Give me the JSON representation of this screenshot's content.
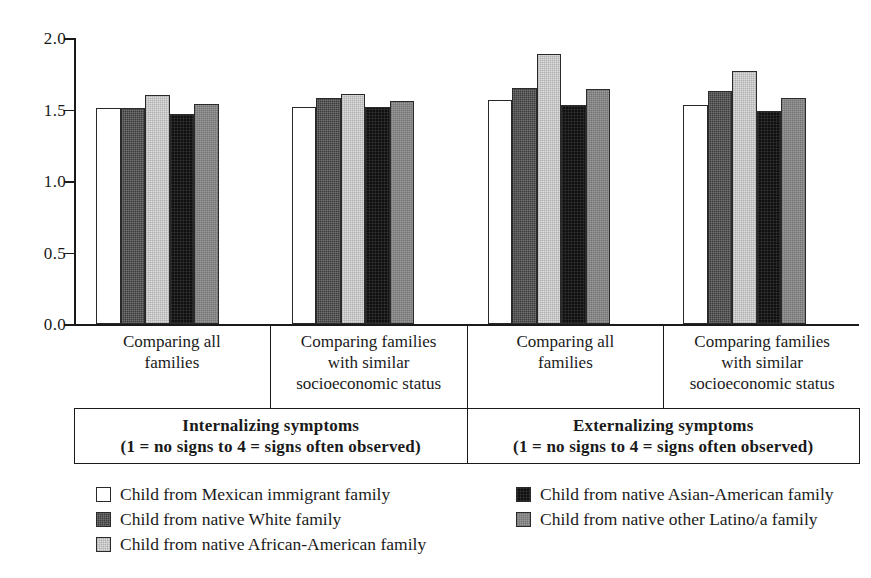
{
  "chart_data": {
    "type": "bar",
    "title": "",
    "xlabel": "",
    "ylabel": "",
    "ylim": [
      0.0,
      2.0
    ],
    "ytick_labels": [
      "2.0",
      "1.5",
      "1.0",
      "0.5",
      "0.0"
    ],
    "ytick_values": [
      2.0,
      1.5,
      1.0,
      0.5,
      0.0
    ],
    "grid": false,
    "legend_position": "below-plot",
    "categories": [
      "Comparing all families",
      "Comparing families with similar socioeconomic status",
      "Comparing all families",
      "Comparing families with similar socioeconomic status"
    ],
    "group_titles": [
      {
        "main": "Internalizing symptoms",
        "sub": "(1 = no signs to 4 = signs often observed)",
        "spans": 2
      },
      {
        "main": "Externalizing symptoms",
        "sub": "(1 = no signs to 4 = signs often observed)",
        "spans": 2
      }
    ],
    "series": [
      {
        "name": "Child from Mexican immigrant family",
        "fill": "white",
        "color": "#ffffff",
        "values": [
          1.51,
          1.52,
          1.57,
          1.53
        ]
      },
      {
        "name": "Child from native White family",
        "fill": "dark-gray",
        "color": "#3d3d3d",
        "values": [
          1.51,
          1.58,
          1.65,
          1.63
        ]
      },
      {
        "name": "Child from native African-American family",
        "fill": "light-gray",
        "color": "#dcdcdc",
        "values": [
          1.6,
          1.61,
          1.89,
          1.77
        ]
      },
      {
        "name": "Child from native Asian-American family",
        "fill": "black",
        "color": "#111111",
        "values": [
          1.47,
          1.52,
          1.53,
          1.49
        ]
      },
      {
        "name": "Child from native other Latino/a family",
        "fill": "mid-gray",
        "color": "#9a9a9a",
        "values": [
          1.54,
          1.56,
          1.64,
          1.58
        ]
      }
    ]
  },
  "axis": {
    "ticks": [
      {
        "label": "2.0",
        "value": 2.0
      },
      {
        "label": "1.5",
        "value": 1.5
      },
      {
        "label": "1.0",
        "value": 1.0
      },
      {
        "label": "0.5",
        "value": 0.5
      },
      {
        "label": "0.0",
        "value": 0.0
      }
    ]
  },
  "categories": [
    {
      "line1": "Comparing all",
      "line2": "families",
      "line3": ""
    },
    {
      "line1": "Comparing families",
      "line2": "with similar",
      "line3": "socioeconomic status"
    },
    {
      "line1": "Comparing all",
      "line2": "families",
      "line3": ""
    },
    {
      "line1": "Comparing families",
      "line2": "with similar",
      "line3": "socioeconomic status"
    }
  ],
  "group_titles": [
    {
      "main": "Internalizing symptoms",
      "sub": "(1 = no signs to 4 = signs often observed)"
    },
    {
      "main": "Externalizing symptoms",
      "sub": "(1 = no signs to 4 = signs often observed)"
    }
  ],
  "legend": {
    "left": [
      {
        "label": "Child from Mexican immigrant family",
        "fill": "white"
      },
      {
        "label": "Child from native White family",
        "fill": "dark-gray"
      },
      {
        "label": "Child from native African-American family",
        "fill": "light-gray"
      }
    ],
    "right": [
      {
        "label": "Child from native Asian-American family",
        "fill": "black"
      },
      {
        "label": "Child from native other Latino/a family",
        "fill": "mid-gray"
      }
    ]
  }
}
